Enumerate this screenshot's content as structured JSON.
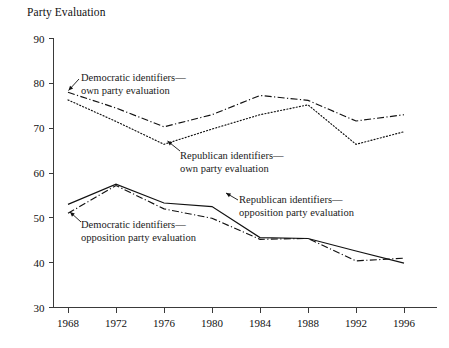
{
  "chart_data": {
    "type": "line",
    "title": "Party Evaluation",
    "xlabel": "",
    "ylabel": "",
    "categories": [
      1968,
      1972,
      1976,
      1980,
      1984,
      1988,
      1992,
      1996
    ],
    "xtick_labels": [
      "1968",
      "1972",
      "1976",
      "1980",
      "1984",
      "1988",
      "1992",
      "1996"
    ],
    "ytick_labels": [
      "30",
      "40",
      "50",
      "60",
      "70",
      "80",
      "90"
    ],
    "yticks": [
      30,
      40,
      50,
      60,
      70,
      80,
      90
    ],
    "ylim": [
      30,
      90
    ],
    "grid": false,
    "legend": "annotations-with-leader-lines",
    "series": [
      {
        "name": "Democratic identifiers—own party evaluation",
        "style": "dash-dot",
        "color": "#111111",
        "values": [
          78.0,
          74.5,
          70.3,
          73.0,
          77.3,
          76.2,
          71.6,
          73.0
        ]
      },
      {
        "name": "Republican identifiers—own party evaluation",
        "style": "dotted",
        "color": "#111111",
        "values": [
          76.3,
          71.5,
          66.4,
          69.8,
          73.0,
          75.2,
          66.4,
          69.2
        ]
      },
      {
        "name": "Republican identifiers—opposition party evaluation",
        "style": "solid",
        "color": "#111111",
        "values": [
          53.0,
          57.5,
          53.3,
          52.5,
          45.6,
          45.4,
          42.6,
          39.9
        ]
      },
      {
        "name": "Democratic identifiers—opposition party evaluation",
        "style": "dash-dot",
        "color": "#111111",
        "values": [
          51.0,
          57.2,
          52.0,
          49.9,
          45.2,
          45.4,
          40.4,
          41.0
        ]
      }
    ],
    "annotations": [
      {
        "id": "anno-dem-own",
        "line1": "Democratic identifiers—",
        "line2": "own party evaluation"
      },
      {
        "id": "anno-rep-own",
        "line1": "Republican identifiers—",
        "line2": "own party evaluation"
      },
      {
        "id": "anno-rep-opp",
        "line1": "Republican identifiers—",
        "line2": "opposition party evaluation"
      },
      {
        "id": "anno-dem-opp",
        "line1": "Democratic identifiers—",
        "line2": "opposition party evaluation"
      }
    ]
  }
}
